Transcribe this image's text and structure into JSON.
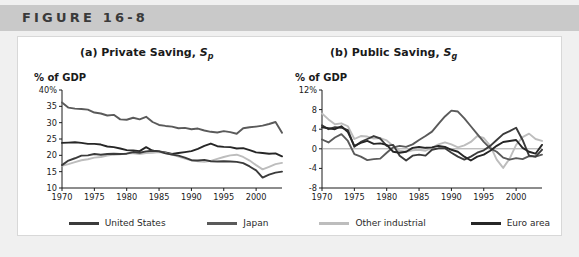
{
  "header": {
    "label": "FIGURE 16-8"
  },
  "colors": {
    "united_states": "#3b3b3b",
    "japan": "#5a5a5a",
    "other_industrial": "#bdbdbd",
    "euro_area": "#262626",
    "header_bar": "#c9c9c9",
    "frame": "#f0f0f0",
    "panel": "#ffffff"
  },
  "legend": {
    "items": [
      {
        "label": "United States",
        "color": "#3b3b3b",
        "key": "united_states"
      },
      {
        "label": "Japan",
        "color": "#5a5a5a",
        "key": "japan"
      },
      {
        "label": "Other industrial",
        "color": "#bdbdbd",
        "key": "other_industrial"
      },
      {
        "label": "Euro area",
        "color": "#262626",
        "key": "euro_area"
      }
    ]
  },
  "chart_data": [
    {
      "id": "private-saving",
      "type": "line",
      "title": "(a) Private Saving, Sp",
      "title_main": "(a) Private Saving,",
      "title_symbol": "S",
      "title_subscript": "p",
      "ylabel": "% of GDP",
      "xlabel": "",
      "xlim": [
        1970,
        2004
      ],
      "ylim": [
        10,
        40
      ],
      "yticks": [
        10,
        15,
        20,
        25,
        30,
        35,
        40
      ],
      "yticklabels": [
        "10",
        "15",
        "20",
        "25",
        "30",
        "35",
        "40%"
      ],
      "xticks": [
        1970,
        1975,
        1980,
        1985,
        1990,
        1995,
        2000
      ],
      "xticklabels": [
        "1970",
        "1975",
        "1980",
        "1985",
        "1990",
        "1995",
        "2000"
      ],
      "grid": false,
      "legend_position": "bottom-shared",
      "x": [
        1970,
        1971,
        1972,
        1973,
        1974,
        1975,
        1976,
        1977,
        1978,
        1979,
        1980,
        1981,
        1982,
        1983,
        1984,
        1985,
        1986,
        1987,
        1988,
        1989,
        1990,
        1991,
        1992,
        1993,
        1994,
        1995,
        1996,
        1997,
        1998,
        1999,
        2000,
        2001,
        2002,
        2003,
        2004
      ],
      "series": [
        {
          "name": "Japan",
          "color": "#5a5a5a",
          "values": [
            36.2,
            34.6,
            34.3,
            34.2,
            34.0,
            33.1,
            32.8,
            32.2,
            32.4,
            31.0,
            30.9,
            31.5,
            31.0,
            31.8,
            30.2,
            29.3,
            29.0,
            28.8,
            28.3,
            28.4,
            28.0,
            28.2,
            27.6,
            27.2,
            27.0,
            27.4,
            27.1,
            26.6,
            28.3,
            28.6,
            28.8,
            29.1,
            29.6,
            30.2,
            26.9
          ]
        },
        {
          "name": "Euro area",
          "color": "#262626",
          "values": [
            23.8,
            23.9,
            24.0,
            23.8,
            23.5,
            23.5,
            23.3,
            22.7,
            22.5,
            22.1,
            21.6,
            21.5,
            21.3,
            22.5,
            21.4,
            21.2,
            20.9,
            20.4,
            20.7,
            21.0,
            21.3,
            22.0,
            22.9,
            23.6,
            22.8,
            22.6,
            22.5,
            22.1,
            22.2,
            21.6,
            20.9,
            20.7,
            20.5,
            20.6,
            19.7
          ]
        },
        {
          "name": "Other industrial",
          "color": "#bdbdbd",
          "values": [
            16.8,
            17.3,
            17.9,
            18.5,
            18.8,
            19.3,
            19.5,
            19.9,
            20.2,
            20.3,
            20.6,
            20.6,
            20.4,
            20.7,
            20.8,
            21.0,
            20.7,
            20.2,
            19.6,
            19.0,
            18.5,
            18.2,
            18.0,
            18.3,
            18.9,
            19.5,
            20.0,
            20.2,
            19.5,
            18.4,
            17.0,
            15.7,
            16.5,
            17.3,
            17.7
          ]
        },
        {
          "name": "United States",
          "color": "#3b3b3b",
          "values": [
            17.0,
            18.4,
            19.1,
            19.9,
            20.0,
            20.4,
            20.2,
            20.4,
            20.5,
            20.4,
            20.5,
            21.0,
            20.8,
            21.2,
            21.4,
            21.2,
            20.6,
            20.2,
            19.9,
            19.3,
            18.5,
            18.4,
            18.6,
            18.2,
            18.1,
            18.2,
            18.1,
            18.0,
            17.6,
            16.6,
            15.4,
            13.2,
            14.1,
            14.7,
            15.0
          ]
        }
      ]
    },
    {
      "id": "public-saving",
      "type": "line",
      "title": "(b) Public Saving, Sg",
      "title_main": "(b) Public Saving,",
      "title_symbol": "S",
      "title_subscript": "g",
      "ylabel": "% of GDP",
      "xlabel": "",
      "xlim": [
        1970,
        2004
      ],
      "ylim": [
        -8,
        12
      ],
      "yticks": [
        -8,
        -4,
        0,
        4,
        8,
        12
      ],
      "yticklabels": [
        "-8",
        "-4",
        "0",
        "4",
        "8",
        "12%"
      ],
      "xticks": [
        1970,
        1975,
        1980,
        1985,
        1990,
        1995,
        2000
      ],
      "xticklabels": [
        "1970",
        "1975",
        "1980",
        "1985",
        "1990",
        "1995",
        "2000"
      ],
      "grid": false,
      "zero_line": true,
      "legend_position": "bottom-shared",
      "x": [
        1970,
        1971,
        1972,
        1973,
        1974,
        1975,
        1976,
        1977,
        1978,
        1979,
        1980,
        1981,
        1982,
        1983,
        1984,
        1985,
        1986,
        1987,
        1988,
        1989,
        1990,
        1991,
        1992,
        1993,
        1994,
        1995,
        1996,
        1997,
        1998,
        1999,
        2000,
        2001,
        2002,
        2003,
        2004
      ],
      "series": [
        {
          "name": "Other industrial",
          "color": "#bdbdbd",
          "values": [
            7.2,
            6.0,
            5.0,
            5.2,
            4.6,
            2.0,
            2.6,
            2.5,
            2.1,
            2.2,
            1.7,
            0.6,
            -0.4,
            -0.6,
            -0.3,
            -0.2,
            -0.4,
            0.2,
            0.9,
            1.3,
            0.9,
            0.3,
            0.7,
            1.4,
            2.6,
            2.2,
            0.6,
            -2.2,
            -3.9,
            -2.0,
            0.8,
            2.4,
            3.1,
            2.0,
            1.6
          ]
        },
        {
          "name": "Japan",
          "color": "#5a5a5a",
          "values": [
            1.9,
            1.3,
            2.3,
            3.0,
            1.6,
            -1.1,
            -1.6,
            -2.3,
            -2.1,
            -2.0,
            -0.8,
            0.3,
            0.6,
            0.4,
            0.9,
            1.8,
            2.6,
            3.5,
            5.1,
            6.6,
            7.8,
            7.6,
            6.2,
            4.6,
            3.0,
            1.4,
            0.1,
            -0.6,
            -1.8,
            -2.2,
            -1.9,
            -2.1,
            -1.5,
            -1.6,
            -1.2
          ]
        },
        {
          "name": "United States",
          "color": "#3b3b3b",
          "values": [
            4.8,
            4.0,
            4.4,
            4.3,
            3.8,
            0.4,
            1.4,
            2.0,
            2.6,
            2.1,
            0.6,
            0.8,
            -1.4,
            -2.4,
            -1.4,
            -1.2,
            -1.4,
            -0.2,
            0.1,
            0.1,
            -0.8,
            -1.6,
            -2.2,
            -1.6,
            -0.8,
            -0.3,
            0.6,
            1.8,
            3.0,
            3.6,
            4.3,
            1.8,
            -1.4,
            -1.6,
            -0.2
          ]
        },
        {
          "name": "Euro area",
          "color": "#262626",
          "values": [
            4.4,
            4.2,
            4.0,
            4.6,
            3.4,
            0.6,
            1.2,
            1.6,
            1.0,
            1.1,
            0.8,
            -0.6,
            -0.8,
            -0.6,
            0.2,
            0.4,
            0.2,
            0.3,
            0.6,
            0.4,
            -0.2,
            -0.6,
            -1.6,
            -2.4,
            -1.6,
            -1.2,
            -0.4,
            0.6,
            1.4,
            1.6,
            1.8,
            0.2,
            -0.6,
            -1.0,
            0.8
          ]
        }
      ]
    }
  ]
}
